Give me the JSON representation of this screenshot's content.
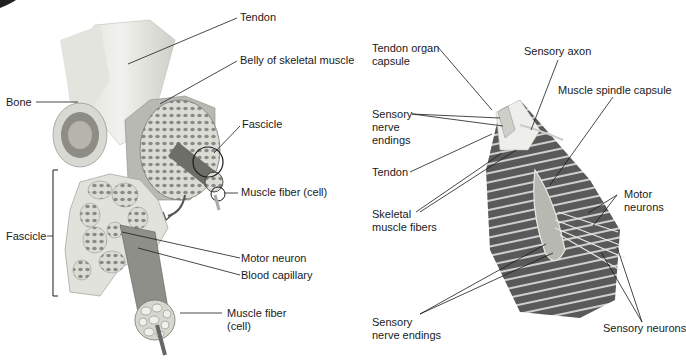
{
  "figure": {
    "left_panel": {
      "title": "Skeletal muscle structure",
      "labels": {
        "tendon": "Tendon",
        "belly": "Belly of skeletal muscle",
        "bone": "Bone",
        "fascicle_top": "Fascicle",
        "muscle_fiber_top": "Muscle fiber (cell)",
        "fascicle_bracket": "Fascicle",
        "motor_neuron": "Motor neuron",
        "blood_capillary": "Blood capillary",
        "muscle_fiber_bottom_1": "Muscle fiber",
        "muscle_fiber_bottom_2": "(cell)"
      }
    },
    "right_panel": {
      "title": "Muscle spindle and tendon organ",
      "labels": {
        "tendon_organ_1": "Tendon organ",
        "tendon_organ_2": "capsule",
        "sensory_axon": "Sensory axon",
        "spindle_capsule": "Muscle spindle capsule",
        "sensory_nerve_1": "Sensory",
        "sensory_nerve_2": "nerve",
        "sensory_nerve_3": "endings",
        "tendon": "Tendon",
        "skeletal_1": "Skeletal",
        "skeletal_2": "muscle fibers",
        "motor_1": "Motor",
        "motor_2": "neurons",
        "sensory_endings_1": "Sensory",
        "sensory_endings_2": "nerve endings",
        "sensory_neurons": "Sensory neurons"
      }
    },
    "colors": {
      "line": "#1a1a1a",
      "muscle_dark": "#5a5a5a",
      "muscle_stripe": "#cfcfcf",
      "tendon": "#e8e8e4",
      "fascicle_fill": "#d8d8d2"
    }
  }
}
